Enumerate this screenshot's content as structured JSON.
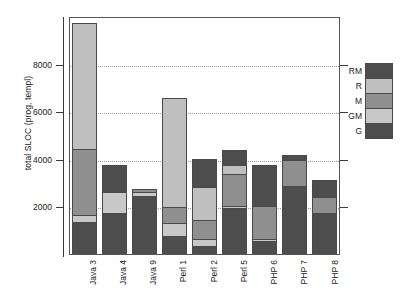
{
  "chart_data": {
    "type": "bar",
    "stacked": true,
    "title": "",
    "xlabel": "",
    "ylabel": "total SLOC (prog, templ)",
    "ylim": [
      0,
      10000
    ],
    "yticks": [
      2000,
      4000,
      6000,
      8000
    ],
    "ytick_labels": [
      "2000",
      "4000",
      "6000",
      "8000"
    ],
    "grid": true,
    "grid_axis": "y",
    "legend_position": "right",
    "categories": [
      "Java 3",
      "Java 4",
      "Java 9",
      "Perl 1",
      "Perl 2",
      "Perl 5",
      "PHP 6",
      "PHP 7",
      "PHP 8"
    ],
    "series": [
      {
        "name": "G",
        "color": "#4d4d4d",
        "values": [
          1300,
          1700,
          2450,
          700,
          300,
          1900,
          500,
          2850,
          1700
        ]
      },
      {
        "name": "GM",
        "color": "#c8c8c8",
        "values": [
          300,
          900,
          150,
          550,
          300,
          100,
          100,
          0,
          0
        ]
      },
      {
        "name": "M",
        "color": "#8f8f8f",
        "values": [
          2800,
          0,
          150,
          700,
          800,
          1350,
          1400,
          1100,
          700
        ]
      },
      {
        "name": "R",
        "color": "#bfbfbf",
        "values": [
          5300,
          0,
          0,
          4600,
          1400,
          400,
          0,
          0,
          0
        ]
      },
      {
        "name": "RM",
        "color": "#4d4d4d",
        "values": [
          0,
          1150,
          0,
          0,
          1200,
          600,
          1750,
          200,
          700
        ]
      }
    ],
    "totals": [
      9700,
      3750,
      2750,
      6550,
      4000,
      4350,
      3750,
      4150,
      3100
    ],
    "legend_entries": [
      {
        "label": "RM",
        "color": "#4d4d4d"
      },
      {
        "label": "R",
        "color": "#bfbfbf"
      },
      {
        "label": "M",
        "color": "#8f8f8f"
      },
      {
        "label": "GM",
        "color": "#c8c8c8"
      },
      {
        "label": "G",
        "color": "#4d4d4d"
      }
    ]
  },
  "colors": {
    "axis": "#3a3a3a",
    "frame": "#555555",
    "grid": "#9a9a9a",
    "background": "#ffffff",
    "text": "#1a1a1a"
  }
}
